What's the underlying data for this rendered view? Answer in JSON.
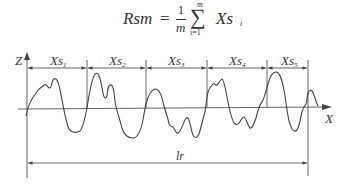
{
  "formula": {
    "lhs": "Rsm",
    "equals": "=",
    "fraction_numerator": "1",
    "fraction_denominator": "m",
    "sum_upper": "m",
    "sum_symbol": "∑",
    "sum_lower": "i=1",
    "term": "Xs",
    "term_subscript": "i"
  },
  "diagram": {
    "z_axis_label": "Z",
    "x_axis_label": "X",
    "segments": [
      {
        "label": "Xs",
        "sub": "1"
      },
      {
        "label": "Xs",
        "sub": "2"
      },
      {
        "label": "Xs",
        "sub": "3"
      },
      {
        "label": "Xs",
        "sub": "4"
      },
      {
        "label": "Xs",
        "sub": "5"
      }
    ],
    "sampling_length_label": "lr",
    "line_color": "#444444"
  }
}
